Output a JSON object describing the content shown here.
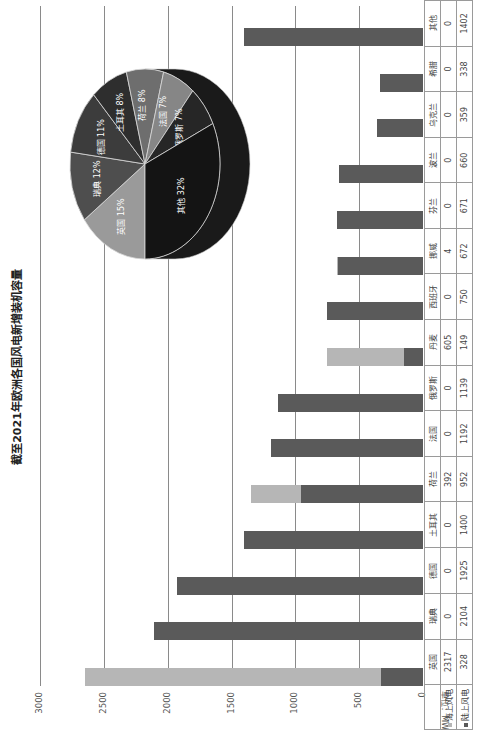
{
  "chart_data": {
    "type": "bar",
    "stacked": true,
    "title": "截至2021年欧洲各国风电新增装机容量",
    "ylabel": "单位：MW",
    "ylim": [
      0,
      3000
    ],
    "yticks": [
      0,
      500,
      1000,
      1500,
      2000,
      2500,
      3000
    ],
    "grid": true,
    "legend_position": "data-table",
    "categories": [
      "英国",
      "瑞典",
      "德国",
      "土耳其",
      "荷兰",
      "法国",
      "俄罗斯",
      "丹麦",
      "西班牙",
      "挪威",
      "芬兰",
      "波兰",
      "乌克兰",
      "希腊",
      "其他"
    ],
    "series": [
      {
        "name": "海上风电",
        "color": "#b6b6b6",
        "values": [
          2317,
          0,
          0,
          0,
          392,
          0,
          0,
          605,
          0,
          4,
          0,
          0,
          0,
          0,
          0
        ]
      },
      {
        "name": "陆上风电",
        "color": "#5a5a5a",
        "values": [
          328,
          2104,
          1925,
          1400,
          952,
          1192,
          1139,
          149,
          750,
          672,
          671,
          660,
          359,
          338,
          1402
        ]
      }
    ],
    "inset_pie": {
      "type": "pie",
      "style": "3d",
      "slices": [
        {
          "label": "英国",
          "percent": 15,
          "color": "#9a9a9a"
        },
        {
          "label": "瑞典",
          "percent": 12,
          "color": "#4e4e4e"
        },
        {
          "label": "德国",
          "percent": 11,
          "color": "#3c3c3c"
        },
        {
          "label": "土耳其",
          "percent": 8,
          "color": "#2e2e2e"
        },
        {
          "label": "荷兰",
          "percent": 8,
          "color": "#6e6e6e"
        },
        {
          "label": "法国",
          "percent": 7,
          "color": "#868686"
        },
        {
          "label": "俄罗斯",
          "percent": 7,
          "color": "#262626"
        },
        {
          "label": "其他",
          "percent": 32,
          "color": "#141414"
        }
      ]
    }
  },
  "labels": {
    "title": "截至2021年欧洲各国风电新增装机容量",
    "unit": "单位：MW",
    "yticks": [
      "0",
      "500",
      "1000",
      "1500",
      "2000",
      "2500",
      "3000"
    ],
    "legend_offshore": "海上风电",
    "legend_onshore": "陆上风电"
  },
  "colors": {
    "offshore": "#b6b6b6",
    "onshore": "#5a5a5a",
    "grid": "#8a8a8a"
  }
}
